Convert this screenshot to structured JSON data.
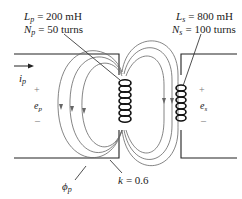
{
  "figure": {
    "primary": {
      "inductance_symbol": "L",
      "inductance_sub": "p",
      "inductance_value": "= 200 mH",
      "turns_symbol": "N",
      "turns_sub": "p",
      "turns_value": "= 50 turns",
      "current_symbol": "i",
      "current_sub": "p",
      "voltage_symbol": "e",
      "voltage_sub": "p",
      "plus": "+",
      "minus": "–"
    },
    "secondary": {
      "inductance_symbol": "L",
      "inductance_sub": "s",
      "inductance_value": "= 800 mH",
      "turns_symbol": "N",
      "turns_sub": "s",
      "turns_value": "= 100 turns",
      "voltage_symbol": "e",
      "voltage_sub": "s",
      "plus": "+",
      "minus": "–"
    },
    "flux": {
      "symbol": "ϕ",
      "sub": "p"
    },
    "coupling": {
      "symbol": "k",
      "value": "= 0.6"
    }
  }
}
